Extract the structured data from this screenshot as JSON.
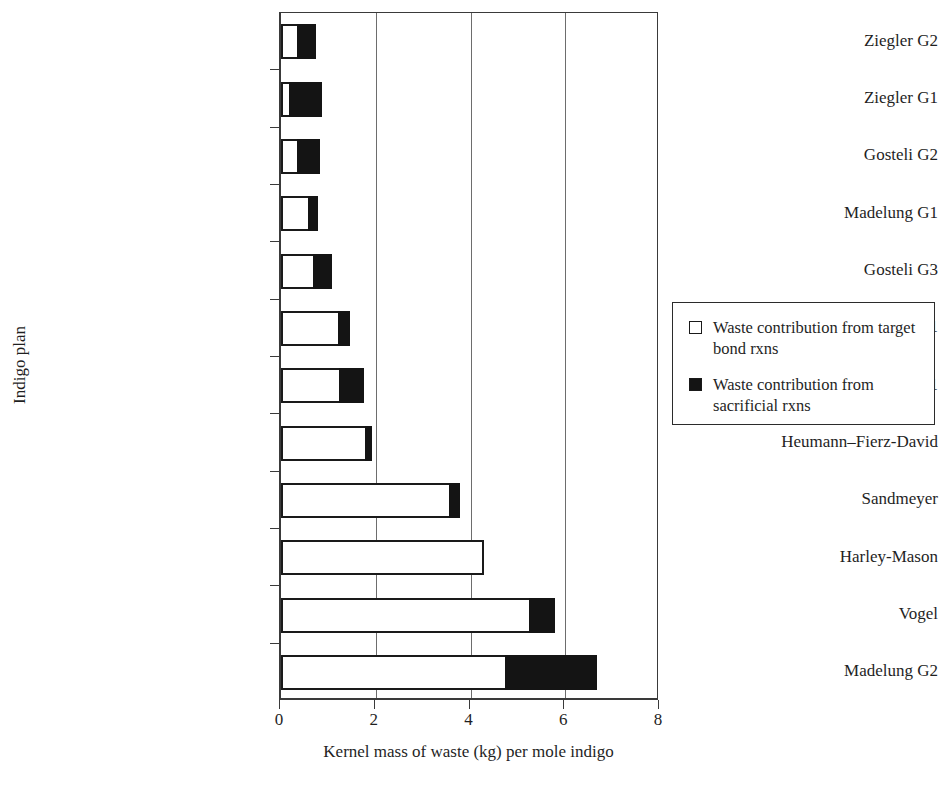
{
  "chart_data": {
    "type": "bar",
    "orientation": "horizontal",
    "stacked": true,
    "title": "",
    "xlabel": "Kernel mass of waste (kg) per mole indigo",
    "ylabel": "Indigo plan",
    "xlim": [
      0,
      8
    ],
    "xticks": [
      0,
      2,
      4,
      6,
      8
    ],
    "grid": "vertical",
    "legend_position": "right",
    "categories": [
      "Ziegler G2",
      "Ziegler G1",
      "Gosteli G2",
      "Madelung G1",
      "Gosteli G3",
      "Gosteli G1",
      "Baeyer G1",
      "Heumann–Fierz-David",
      "Sandmeyer",
      "Harley-Mason",
      "Vogel",
      "Madelung G2"
    ],
    "series": [
      {
        "name": "Waste contribution from target bond rxns",
        "color": "#ffffff",
        "values": [
          0.38,
          0.21,
          0.38,
          0.61,
          0.72,
          1.25,
          1.27,
          1.82,
          3.58,
          4.28,
          5.27,
          4.78
        ]
      },
      {
        "name": "Waste contribution from sacrificial rxns",
        "color": "#141414",
        "values": [
          0.36,
          0.66,
          0.44,
          0.17,
          0.36,
          0.21,
          0.49,
          0.11,
          0.19,
          0.0,
          0.51,
          1.89
        ]
      }
    ],
    "totals": [
      0.74,
      0.87,
      0.82,
      0.78,
      1.08,
      1.46,
      1.76,
      1.93,
      3.77,
      4.28,
      5.78,
      6.67
    ]
  },
  "legend": {
    "items": [
      {
        "swatch": "open-square-swatch",
        "label": "Waste contribution from target bond rxns"
      },
      {
        "swatch": "filled-square-swatch",
        "label": "Waste contribution from sacrificial rxns"
      }
    ]
  }
}
